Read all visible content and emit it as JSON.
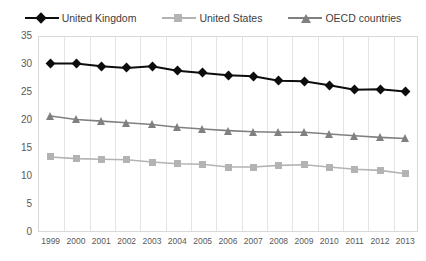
{
  "chart_data": {
    "type": "line",
    "title": "",
    "subtitle": "",
    "xlabel": "",
    "ylabel": "",
    "x": [
      1999,
      2000,
      2001,
      2002,
      2003,
      2004,
      2005,
      2006,
      2007,
      2008,
      2009,
      2010,
      2011,
      2012,
      2013
    ],
    "xtick_labels": [
      "1999",
      "2000",
      "2001",
      "2002",
      "2003",
      "2004",
      "2005",
      "2006",
      "2007",
      "2008",
      "2009",
      "2010",
      "2011",
      "2012",
      "2013"
    ],
    "ytick_labels": [
      "0",
      "5",
      "10",
      "15",
      "20",
      "25",
      "30",
      "35"
    ],
    "ytick_values": [
      0,
      5,
      10,
      15,
      20,
      25,
      30,
      35
    ],
    "ylim": [
      0,
      35
    ],
    "grid": "vertical",
    "legend_position": "top",
    "series": [
      {
        "name": "United Kingdom",
        "color": "#0d0d0d",
        "marker": "diamond",
        "values": [
          30.1,
          30.1,
          29.6,
          29.3,
          29.6,
          28.8,
          28.4,
          28.0,
          27.8,
          27.0,
          26.9,
          26.2,
          25.4,
          25.5,
          25.1
        ]
      },
      {
        "name": "United States",
        "color": "#b3b3b3",
        "marker": "square",
        "values": [
          13.4,
          13.1,
          13.0,
          12.9,
          12.5,
          12.2,
          12.1,
          11.6,
          11.6,
          11.9,
          12.0,
          11.6,
          11.2,
          11.0,
          10.4
        ]
      },
      {
        "name": "OECD countries",
        "color": "#808080",
        "marker": "triangle",
        "values": [
          20.7,
          20.1,
          19.8,
          19.5,
          19.2,
          18.7,
          18.4,
          18.1,
          17.9,
          17.8,
          17.8,
          17.5,
          17.2,
          16.9,
          16.7
        ]
      }
    ]
  }
}
